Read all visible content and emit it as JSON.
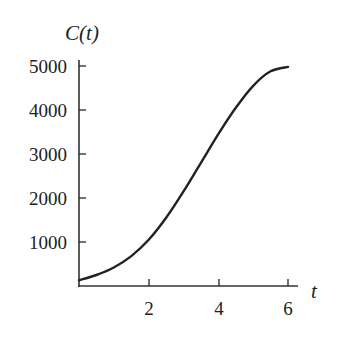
{
  "chart_data": {
    "type": "line",
    "title": "",
    "xlabel": "t",
    "ylabel": "C(t)",
    "xlim": [
      0,
      6
    ],
    "ylim": [
      0,
      5000
    ],
    "x_ticks": [
      2,
      4,
      6
    ],
    "y_ticks": [
      1000,
      2000,
      3000,
      4000,
      5000
    ],
    "x_tick_labels": [
      "2",
      "4",
      "6"
    ],
    "y_tick_labels": [
      "1000",
      "2000",
      "3000",
      "4000",
      "5000"
    ],
    "grid": false,
    "legend": null,
    "series": [
      {
        "name": "C(t)",
        "x": [
          0,
          0.5,
          1,
          1.5,
          2,
          2.5,
          3,
          3.5,
          4,
          4.5,
          5,
          5.5,
          6
        ],
        "values": [
          130,
          250,
          420,
          680,
          1050,
          1550,
          2150,
          2800,
          3450,
          4050,
          4550,
          4880,
          4980
        ]
      }
    ],
    "colors": {
      "line": "#222222",
      "axis": "#333333"
    }
  }
}
